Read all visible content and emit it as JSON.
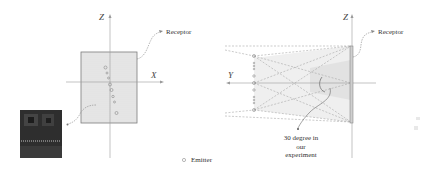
{
  "left_view": {
    "axis_z_label": "Z",
    "axis_x_label": "X",
    "receptor_label": "Receptor",
    "emitter_count": 8,
    "receptor_fill": "#e6e6e6",
    "receptor_border": "#7a7a7a",
    "inset_image": "dark photo of emitter array"
  },
  "right_view": {
    "axis_z_label": "Z",
    "axis_y_label": "Y",
    "receptor_label": "Receptor",
    "angle_note": [
      "30 degree in",
      "our",
      "experiment"
    ]
  },
  "legend": {
    "emitter_label": "Emitter",
    "emitter_symbol": "circle"
  },
  "colors": {
    "axis": "#9a9a9a",
    "dashed": "#a8a8a8",
    "cone_fill": "#dcdcdc",
    "text": "#333333"
  }
}
